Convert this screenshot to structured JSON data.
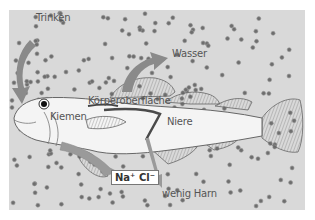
{
  "diagram": {
    "colors": {
      "background": "#ffffff",
      "seawater": "#d9d9d9",
      "fish_body": "#f4f4f4",
      "fish_outline": "#666666",
      "particles": "#6e6e6e",
      "arrows": "#8a8a8a",
      "kidney": "#4a4a4a"
    },
    "labels": {
      "drink": "Trinken",
      "water": "Wasser",
      "body_surface": "Körperoberfläche",
      "gills": "Kiemen",
      "kidney": "Niere",
      "salt": "Na⁺ Cl⁻",
      "urine": "wenig Harn"
    },
    "arrows": [
      {
        "id": "drink-arrow",
        "from": "Meerwasser",
        "to": "Maul",
        "meaning": "Trinken"
      },
      {
        "id": "water-loss-arrow",
        "from": "Körperoberfläche",
        "to": "Meerwasser",
        "meaning": "Wasser"
      },
      {
        "id": "salt-excretion-arrow",
        "from": "Kiemen",
        "to": "Meerwasser",
        "meaning": "Na⁺ Cl⁻"
      },
      {
        "id": "urine-arrow",
        "from": "Niere",
        "to": "Meerwasser",
        "meaning": "wenig Harn"
      }
    ]
  }
}
